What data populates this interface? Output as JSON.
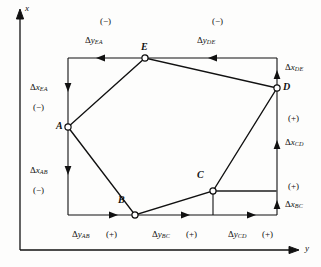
{
  "figure": {
    "type": "surveying-traverse-projection-diagram",
    "axes": {
      "vertical_label": "x",
      "horizontal_label": "y"
    }
  },
  "vertices": [
    {
      "name": "A",
      "x": 68,
      "y": 127,
      "label_dx": -12,
      "label_dy": -6
    },
    {
      "name": "B",
      "x": 135,
      "y": 215,
      "label_dx": -17,
      "label_dy": -20
    },
    {
      "name": "C",
      "x": 213,
      "y": 191,
      "label_dx": -16,
      "label_dy": -21
    },
    {
      "name": "D",
      "x": 277,
      "y": 88,
      "label_dx": 6,
      "label_dy": -6
    },
    {
      "name": "E",
      "x": 145,
      "y": 58,
      "label_dx": -4,
      "label_dy": -16
    }
  ],
  "bounding_box": {
    "left": 68,
    "top": 58,
    "right": 277,
    "bottom": 215
  },
  "labels": {
    "top_left_sign": {
      "text": "(−)",
      "x": 100,
      "y": 17
    },
    "top_right_sign": {
      "text": "(−)",
      "x": 212,
      "y": 17
    },
    "dy_EA": {
      "delta": "Δ",
      "var": "y",
      "sub": "EA",
      "x": 85,
      "y": 36
    },
    "dy_DE": {
      "delta": "Δ",
      "var": "y",
      "sub": "DE",
      "x": 197,
      "y": 36
    },
    "dx_EA": {
      "delta": "Δ",
      "var": "x",
      "sub": "EA",
      "x": 30,
      "y": 83
    },
    "left_upper_sign": {
      "text": "(−)",
      "x": 33,
      "y": 103
    },
    "dx_AB": {
      "delta": "Δ",
      "var": "x",
      "sub": "AB",
      "x": 30,
      "y": 166
    },
    "left_lower_sign": {
      "text": "(−)",
      "x": 33,
      "y": 186
    },
    "dx_DE": {
      "delta": "Δ",
      "var": "x",
      "sub": "DE",
      "x": 285,
      "y": 68
    },
    "right_sign_1": {
      "text": "(+)",
      "x": 288,
      "y": 114
    },
    "dx_CD": {
      "delta": "Δ",
      "var": "x",
      "sub": "CD",
      "x": 285,
      "y": 138
    },
    "right_sign_2": {
      "text": "(+)",
      "x": 288,
      "y": 182
    },
    "dx_BC": {
      "delta": "Δ",
      "var": "x",
      "sub": "BC",
      "x": 285,
      "y": 204
    },
    "dy_AB": {
      "delta": "Δ",
      "var": "y",
      "sub": "AB",
      "x": 72,
      "y": 230
    },
    "sign_AB": {
      "text": "(+)",
      "x": 104,
      "y": 230
    },
    "dy_BC": {
      "delta": "Δ",
      "var": "y",
      "sub": "BC",
      "x": 152,
      "y": 230
    },
    "sign_BC": {
      "text": "(+)",
      "x": 184,
      "y": 230
    },
    "dy_CD": {
      "delta": "Δ",
      "var": "y",
      "sub": "CD",
      "x": 228,
      "y": 230
    },
    "sign_CD": {
      "text": "(+)",
      "x": 262,
      "y": 230
    },
    "axis_x": {
      "text": "x",
      "x": 25,
      "y": 4
    },
    "axis_y": {
      "text": "y",
      "x": 305,
      "y": 244
    }
  },
  "colors": {
    "stroke": "#111111",
    "background": "#fdfdfc",
    "emphasis_stroke": "#555555"
  }
}
